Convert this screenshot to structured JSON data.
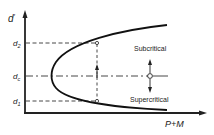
{
  "diagram": {
    "y_axis_label": "d",
    "x_axis_label": "P+M",
    "levels": [
      {
        "id": "d2",
        "label": "d",
        "sub": "2"
      },
      {
        "id": "dc",
        "label": "d",
        "sub": "c"
      },
      {
        "id": "d1",
        "label": "d",
        "sub": "1"
      }
    ],
    "regions": {
      "upper": "Subcritical",
      "lower": "Supercritical"
    },
    "colors": {
      "ink": "#222222",
      "background": "#ffffff"
    }
  }
}
